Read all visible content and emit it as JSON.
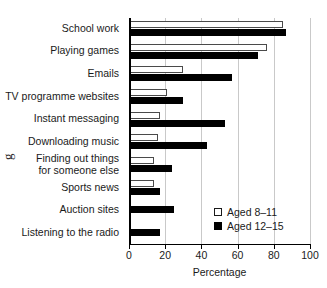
{
  "artifact": {
    "glyph": "g"
  },
  "chart_data": {
    "type": "bar",
    "orientation": "horizontal",
    "title": "",
    "xlabel": "Percentage",
    "ylabel": "",
    "xlim": [
      0,
      100
    ],
    "xticks": [
      0,
      20,
      40,
      60,
      80,
      100
    ],
    "xticklabels": [
      "0",
      "20",
      "40",
      "60",
      "80",
      "100"
    ],
    "grid": "vertical",
    "legend_position": "inside-lower-right",
    "categories": [
      "School work",
      "Playing games",
      "Emails",
      "TV programme websites",
      "Instant messaging",
      "Downloading music",
      "Finding out things\nfor someone else",
      "Sports news",
      "Auction sites",
      "Listening to the radio"
    ],
    "series": [
      {
        "name": "Aged 8–11",
        "style": "open",
        "values": [
          85,
          76,
          30,
          21,
          17,
          16,
          14,
          14,
          null,
          null
        ]
      },
      {
        "name": "Aged 12–15",
        "style": "filled",
        "values": [
          87,
          71,
          57,
          30,
          53,
          43,
          24,
          17,
          25,
          17
        ]
      }
    ],
    "colors": {
      "series_open_fill": "#ffffff",
      "series_open_edge": "#4a4a4a",
      "series_filled": "#000000",
      "gridline": "#c9c9c9",
      "axis": "#000000",
      "text": "#1a1a1a",
      "background": "#ffffff"
    }
  }
}
